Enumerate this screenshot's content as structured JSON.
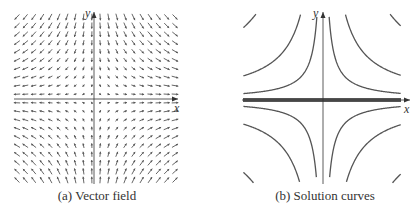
{
  "figure": {
    "panels": [
      {
        "id": "a",
        "caption": "(a) Vector field",
        "x_axis_label": "x",
        "y_axis_label": "y",
        "field": "saddle vector field, arrows flow in along y and out along x",
        "grid": {
          "cols": 20,
          "rows": 20
        }
      },
      {
        "id": "b",
        "caption": "(b) Solution curves",
        "x_axis_label": "x",
        "y_axis_label": "y",
        "curves": "hyperbolas xy = c approaching both axes",
        "curve_constants": [
          0.08,
          0.3,
          0.9
        ]
      }
    ],
    "colors": {
      "axis": "#333333",
      "arrow": "#555555",
      "curve": "#555555"
    }
  }
}
